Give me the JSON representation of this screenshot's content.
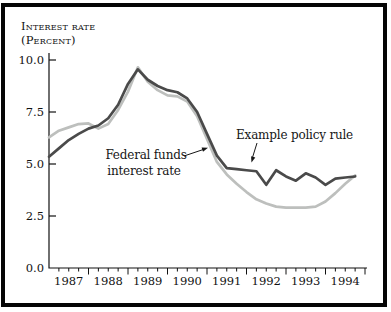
{
  "figure": {
    "title_line1": "Interest rate",
    "title_line2": "(Percent)",
    "background_color": "#ffffff",
    "frame_color": "#050505"
  },
  "chart_data": {
    "type": "line",
    "title": "Interest rate",
    "ylabel_note": "(Percent)",
    "x_frequency": "quarterly",
    "x_range": [
      "1987Q1",
      "1994Q4"
    ],
    "ylim": [
      0,
      10
    ],
    "y_tick_values": [
      10.0,
      7.5,
      5.0,
      2.5,
      0.0
    ],
    "y_tick_labels": [
      "10.0",
      "7.5",
      "5.0",
      "2.5",
      "0.0"
    ],
    "x_tick_labels": [
      "1987",
      "1988",
      "1989",
      "1990",
      "1991",
      "1992",
      "1993",
      "1994"
    ],
    "grid": "off",
    "legend_position": "inline-annotations",
    "series": [
      {
        "name": "Example policy rule",
        "color": "#4a4a4a",
        "values": [
          5.35,
          5.75,
          6.15,
          6.45,
          6.7,
          6.85,
          7.2,
          7.85,
          8.85,
          9.55,
          9.05,
          8.75,
          8.55,
          8.45,
          8.15,
          7.5,
          6.45,
          5.4,
          4.8,
          4.75,
          4.7,
          4.65,
          4.0,
          4.7,
          4.4,
          4.2,
          4.55,
          4.35,
          4.0,
          4.3,
          4.35,
          4.4
        ]
      },
      {
        "name": "Federal funds interest rate",
        "color": "#bdbfbd",
        "values": [
          6.28,
          6.6,
          6.76,
          6.92,
          6.95,
          6.7,
          6.92,
          7.6,
          8.48,
          9.65,
          8.95,
          8.55,
          8.3,
          8.25,
          8.0,
          7.3,
          6.2,
          5.1,
          4.5,
          4.05,
          3.65,
          3.3,
          3.1,
          2.95,
          2.9,
          2.9,
          2.9,
          2.95,
          3.2,
          3.6,
          4.05,
          4.45
        ]
      }
    ],
    "annotations": [
      {
        "text": "Example policy rule",
        "points_to": "Example policy rule line"
      },
      {
        "line1": "Federal funds",
        "line2": "interest rate",
        "points_to": "Federal funds interest rate line"
      }
    ]
  }
}
